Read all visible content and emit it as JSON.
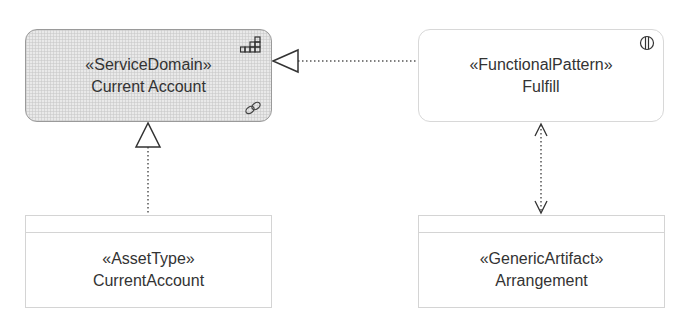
{
  "diagram": {
    "nodes": [
      {
        "id": "service-domain",
        "stereotype": "«ServiceDomain»",
        "name": "Current Account",
        "icons": [
          "grid-staircase-icon",
          "link-chain-icon"
        ],
        "fill": "#e9e9e9"
      },
      {
        "id": "functional-pattern",
        "stereotype": "«FunctionalPattern»",
        "name": "Fulfill",
        "icons": [
          "split-circle-icon"
        ],
        "fill": "#ffffff"
      },
      {
        "id": "asset-type",
        "stereotype": "«AssetType»",
        "name": "CurrentAccount",
        "fill": "#ffffff"
      },
      {
        "id": "generic-artifact",
        "stereotype": "«GenericArtifact»",
        "name": "Arrangement",
        "fill": "#ffffff"
      }
    ],
    "edges": [
      {
        "from": "functional-pattern",
        "to": "service-domain",
        "style": "dotted",
        "head": "hollow-triangle"
      },
      {
        "from": "asset-type",
        "to": "service-domain",
        "style": "dotted",
        "head": "hollow-triangle"
      },
      {
        "from": "functional-pattern",
        "to": "generic-artifact",
        "style": "dotted",
        "head": "open-arrow-both-ends"
      }
    ]
  }
}
